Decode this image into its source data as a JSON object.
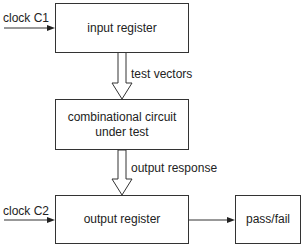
{
  "diagram": {
    "blocks": {
      "input_register": {
        "label": "input register"
      },
      "combinational_circuit": {
        "line1": "combinational circuit",
        "line2": "under test"
      },
      "output_register": {
        "label": "output register"
      },
      "pass_fail": {
        "label": "pass/fail"
      }
    },
    "signals": {
      "clock_c1": "clock C1",
      "clock_c2": "clock C2",
      "test_vectors": "test vectors",
      "output_response": "output response"
    },
    "colors": {
      "stroke": "#333333",
      "text": "#222222",
      "background": "#ffffff"
    }
  }
}
